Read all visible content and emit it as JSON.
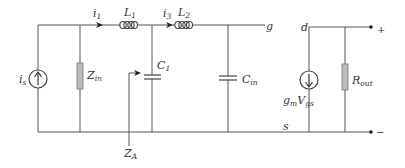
{
  "diagram": {
    "type": "small-signal equivalent circuit",
    "labels": {
      "source_current": {
        "main": "i",
        "sub": "s"
      },
      "input_impedance": {
        "main": "Z",
        "sub": "in"
      },
      "current_1": {
        "main": "i",
        "sub": "1"
      },
      "inductor_1": {
        "main": "L",
        "sub": "1"
      },
      "current_3": {
        "main": "i",
        "sub": "3"
      },
      "inductor_2": {
        "main": "L",
        "sub": "2"
      },
      "capacitor_1": {
        "main": "C",
        "sub": "1"
      },
      "impedance_a": {
        "main": "Z",
        "sub": "A"
      },
      "input_capacitance": {
        "main": "C",
        "sub": "in"
      },
      "gate_node": "g",
      "drain_node": "d",
      "source_node": "s",
      "transconductance": {
        "g": "g",
        "g_sub": "m",
        "v": "V",
        "v_sub": "gs"
      },
      "output_resistance": {
        "main": "R",
        "sub": "out"
      },
      "plus_terminal": "+",
      "minus_terminal": "−"
    },
    "colors": {
      "wire": "#555555",
      "resistor_fill": "#bbbbbb",
      "text": "#333333"
    }
  }
}
